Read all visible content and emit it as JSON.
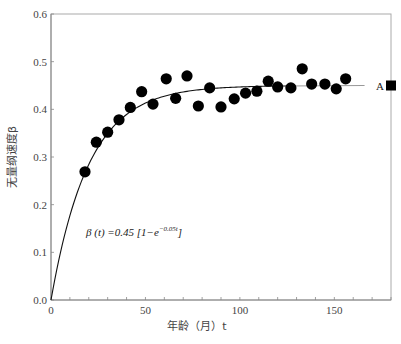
{
  "chart_data": {
    "type": "scatter",
    "title": "",
    "xlabel": "年龄（月）t",
    "ylabel": "无量纲速度β",
    "xlim": [
      0,
      180
    ],
    "ylim": [
      0,
      0.6
    ],
    "x_ticks": [
      0,
      50,
      100,
      150
    ],
    "x_minor_step": 10,
    "y_ticks": [
      "0.0",
      "0.1",
      "0.2",
      "0.3",
      "0.4",
      "0.5",
      "0.6"
    ],
    "grid": false,
    "legend": null,
    "series": [
      {
        "name": "observed",
        "kind": "scatter",
        "marker": "filled-circle",
        "color": "#000000",
        "points": [
          {
            "x": 18,
            "y": 0.269
          },
          {
            "x": 24,
            "y": 0.331
          },
          {
            "x": 30,
            "y": 0.352
          },
          {
            "x": 36,
            "y": 0.378
          },
          {
            "x": 42,
            "y": 0.404
          },
          {
            "x": 48,
            "y": 0.437
          },
          {
            "x": 54,
            "y": 0.411
          },
          {
            "x": 61,
            "y": 0.464
          },
          {
            "x": 66,
            "y": 0.423
          },
          {
            "x": 72,
            "y": 0.47
          },
          {
            "x": 78,
            "y": 0.407
          },
          {
            "x": 84,
            "y": 0.445
          },
          {
            "x": 90,
            "y": 0.405
          },
          {
            "x": 97,
            "y": 0.422
          },
          {
            "x": 103,
            "y": 0.434
          },
          {
            "x": 109,
            "y": 0.438
          },
          {
            "x": 115,
            "y": 0.459
          },
          {
            "x": 120,
            "y": 0.447
          },
          {
            "x": 127,
            "y": 0.445
          },
          {
            "x": 133,
            "y": 0.485
          },
          {
            "x": 138,
            "y": 0.453
          },
          {
            "x": 145,
            "y": 0.453
          },
          {
            "x": 151,
            "y": 0.443
          },
          {
            "x": 156,
            "y": 0.464
          }
        ]
      },
      {
        "name": "fit",
        "kind": "line",
        "color": "#000000",
        "formula": "β(t) = 0.45 [1 − e^(−0.05t)]",
        "a": 0.45,
        "k": 0.05,
        "x_range": [
          0,
          166
        ]
      },
      {
        "name": "A",
        "kind": "marker",
        "marker": "filled-square",
        "color": "#000000",
        "points": [
          {
            "x": 180,
            "y": 0.45
          }
        ]
      }
    ],
    "annotations": [
      {
        "text": "A",
        "x": 170,
        "y": 0.45
      },
      {
        "text_main": "β (t) =0.45 [1−e",
        "text_sup": "−0.05t",
        "text_tail": "]",
        "x": 18,
        "y": 0.135
      }
    ]
  },
  "labels": {
    "xlabel": "年龄（月）t",
    "ylabel": "无量纲速度β",
    "point_A": "A",
    "formula_main": "β (t) =0.45 [1−e",
    "formula_sup": "−0.05t",
    "formula_tail": "]"
  }
}
